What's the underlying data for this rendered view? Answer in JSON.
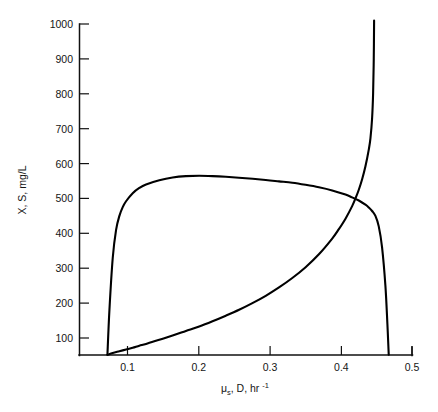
{
  "chart_data": {
    "type": "line",
    "title": "",
    "subtitle": "",
    "xlabel": "μ s, D, hr -1",
    "xlabel_parts": {
      "symbol": "μ",
      "subscript": "s",
      "middle": ", D, hr",
      "superscript": "-1"
    },
    "ylabel": "X, S, mg/L",
    "xlim": [
      0.04,
      0.5
    ],
    "ylim": [
      50,
      1000
    ],
    "xticks": [
      0.1,
      0.2,
      0.3,
      0.4,
      0.5
    ],
    "xtick_labels": [
      "0.1",
      "0.2",
      "0.3",
      "0.4",
      "0.5"
    ],
    "yticks": [
      100,
      200,
      300,
      400,
      500,
      600,
      700,
      800,
      900,
      1000
    ],
    "ytick_labels": [
      "100",
      "200",
      "300",
      "400",
      "500",
      "600",
      "700",
      "800",
      "900",
      "1000"
    ],
    "grid": false,
    "legend": "none",
    "line_color": "#000000",
    "axis_color": "#111111",
    "background_color": "#ffffff",
    "series": [
      {
        "name": "X",
        "description": "Biomass concentration versus dilution rate",
        "x": [
          0.042,
          0.045,
          0.05,
          0.055,
          0.06,
          0.065,
          0.07,
          0.08,
          0.09,
          0.1,
          0.12,
          0.14,
          0.16,
          0.18,
          0.2,
          0.22,
          0.25,
          0.28,
          0.3,
          0.32,
          0.34,
          0.36,
          0.38,
          0.4,
          0.41,
          0.42,
          0.43,
          0.435,
          0.44,
          0.445,
          0.45,
          0.455,
          0.46,
          0.463,
          0.465
        ],
        "y": [
          52,
          180,
          330,
          410,
          450,
          475,
          492,
          515,
          530,
          540,
          552,
          560,
          564,
          565,
          564,
          562,
          558,
          553,
          549,
          545,
          539,
          532,
          523,
          511,
          503,
          494,
          482,
          474,
          464,
          450,
          420,
          360,
          250,
          140,
          52
        ]
      },
      {
        "name": "S",
        "description": "Substrate concentration versus dilution rate",
        "x": [
          0.042,
          0.05,
          0.06,
          0.07,
          0.08,
          0.09,
          0.1,
          0.12,
          0.14,
          0.16,
          0.18,
          0.2,
          0.22,
          0.24,
          0.26,
          0.28,
          0.3,
          0.32,
          0.34,
          0.36,
          0.38,
          0.39,
          0.4,
          0.41,
          0.415,
          0.42,
          0.425,
          0.43,
          0.435,
          0.4375,
          0.44,
          0.4415,
          0.4425,
          0.443
        ],
        "y": [
          52,
          57,
          62,
          67,
          72,
          78,
          83,
          95,
          107,
          120,
          133,
          148,
          164,
          181,
          200,
          221,
          245,
          272,
          303,
          340,
          385,
          412,
          442,
          478,
          500,
          525,
          555,
          592,
          640,
          672,
          730,
          800,
          900,
          1010
        ]
      }
    ],
    "annotations": [
      {
        "name": "curve-crossing",
        "x": 0.431,
        "y": 443,
        "note": "X and S curves intersect"
      },
      {
        "name": "x-curve-peak",
        "x": 0.18,
        "y": 565,
        "note": "Maximum biomass concentration"
      },
      {
        "name": "washout-point",
        "x": 0.465,
        "y": 0,
        "note": "Biomass washout, X falls to zero"
      }
    ]
  }
}
